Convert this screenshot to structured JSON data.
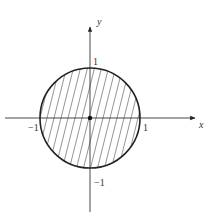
{
  "figure": {
    "axes": {
      "x_label": "x",
      "y_label": "y"
    },
    "tick_labels": {
      "x_neg": "−1",
      "x_pos": "1",
      "y_pos": "1",
      "y_neg": "−1"
    },
    "colors": {
      "stroke": "#222222",
      "hatch": "#555555",
      "background": "#ffffff"
    },
    "region": "hatched-disk",
    "origin_marker": "filled-dot"
  }
}
